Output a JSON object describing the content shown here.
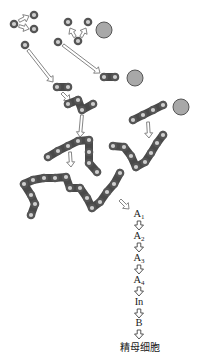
{
  "diagram": {
    "title": "",
    "colors": {
      "bead_outer": "#555555",
      "bead_inner": "#cfcfcf",
      "chain_link": "#4a4a4a",
      "cell": "#a8a8a8",
      "cell_border": "#555555",
      "arrow": "#777777"
    },
    "cells": [
      {
        "id": "cell-1",
        "x": 104,
        "y": 30,
        "r": 8
      },
      {
        "id": "cell-2",
        "x": 135,
        "y": 78,
        "r": 8
      },
      {
        "id": "cell-3",
        "x": 181,
        "y": 107,
        "r": 8
      }
    ],
    "chains": [
      {
        "id": "single-top-left",
        "beads": [
          [
            14,
            24
          ]
        ]
      },
      {
        "id": "single-a",
        "beads": [
          [
            34,
            15
          ]
        ]
      },
      {
        "id": "single-b",
        "beads": [
          [
            34,
            29
          ]
        ]
      },
      {
        "id": "single-c",
        "beads": [
          [
            25,
            45
          ]
        ]
      },
      {
        "id": "single-d",
        "beads": [
          [
            68,
            22
          ]
        ]
      },
      {
        "id": "single-e",
        "beads": [
          [
            88,
            22
          ]
        ]
      },
      {
        "id": "single-f",
        "beads": [
          [
            78,
            41
          ]
        ]
      },
      {
        "id": "single-g",
        "beads": [
          [
            58,
            42
          ]
        ]
      },
      {
        "id": "pair-left",
        "beads": [
          [
            57,
            87
          ],
          [
            68,
            87
          ]
        ]
      },
      {
        "id": "pair-right",
        "beads": [
          [
            104,
            77
          ],
          [
            115,
            77
          ]
        ]
      },
      {
        "id": "four-bead",
        "beads": [
          [
            68,
            104
          ],
          [
            78,
            100
          ],
          [
            82,
            110
          ],
          [
            93,
            104
          ]
        ]
      },
      {
        "id": "eight-bead",
        "beads": [
          [
            48,
            157
          ],
          [
            58,
            151
          ],
          [
            68,
            146
          ],
          [
            78,
            141
          ],
          [
            89,
            140
          ],
          [
            89,
            152
          ],
          [
            89,
            163
          ],
          [
            97,
            172
          ]
        ]
      },
      {
        "id": "right-upper",
        "beads": [
          [
            133,
            120
          ],
          [
            143,
            115
          ],
          [
            153,
            110
          ],
          [
            163,
            105
          ]
        ]
      },
      {
        "id": "right-v",
        "beads": [
          [
            113,
            146
          ],
          [
            124,
            147
          ],
          [
            131,
            156
          ],
          [
            136,
            167
          ],
          [
            145,
            162
          ],
          [
            151,
            153
          ],
          [
            157,
            143
          ],
          [
            163,
            135
          ]
        ]
      },
      {
        "id": "long-chain",
        "beads": [
          [
            31,
            215
          ],
          [
            35,
            204
          ],
          [
            31,
            195
          ],
          [
            24,
            184
          ],
          [
            33,
            180
          ],
          [
            44,
            178
          ],
          [
            55,
            178
          ],
          [
            66,
            177
          ],
          [
            70,
            188
          ],
          [
            80,
            188
          ],
          [
            87,
            198
          ],
          [
            92,
            208
          ],
          [
            100,
            202
          ],
          [
            107,
            192
          ],
          [
            114,
            184
          ],
          [
            120,
            173
          ]
        ]
      }
    ],
    "arrows": [
      {
        "from": [
          19,
          21
        ],
        "to": [
          29,
          16
        ]
      },
      {
        "from": [
          19,
          26
        ],
        "to": [
          29,
          29
        ]
      },
      {
        "from": [
          75,
          37
        ],
        "to": [
          70,
          28
        ]
      },
      {
        "from": [
          81,
          37
        ],
        "to": [
          86,
          28
        ]
      },
      {
        "from": [
          28,
          50
        ],
        "to": [
          53,
          82
        ]
      },
      {
        "from": [
          63,
          45
        ],
        "to": [
          100,
          73
        ]
      },
      {
        "from": [
          62,
          93
        ],
        "to": [
          70,
          101
        ]
      },
      {
        "from": [
          82,
          115
        ],
        "to": [
          80,
          137
        ]
      },
      {
        "from": [
          70,
          152
        ],
        "to": [
          71,
          167
        ]
      },
      {
        "from": [
          148,
          122
        ],
        "to": [
          149,
          138
        ]
      },
      {
        "from": [
          120,
          200
        ],
        "to": [
          129,
          209
        ]
      }
    ],
    "sequence": {
      "stages": [
        {
          "base": "A",
          "sub": "1",
          "y": 208
        },
        {
          "base": "A",
          "sub": "2",
          "y": 230
        },
        {
          "base": "A",
          "sub": "3",
          "y": 252
        },
        {
          "base": "A",
          "sub": "4",
          "y": 274
        },
        {
          "base": "In",
          "sub": "",
          "y": 296
        },
        {
          "base": "B",
          "sub": "",
          "y": 317
        }
      ],
      "down_arrows_y": [
        221,
        243,
        265,
        287,
        309,
        330
      ],
      "final_label": "精母细胞",
      "final_y": 339
    }
  }
}
